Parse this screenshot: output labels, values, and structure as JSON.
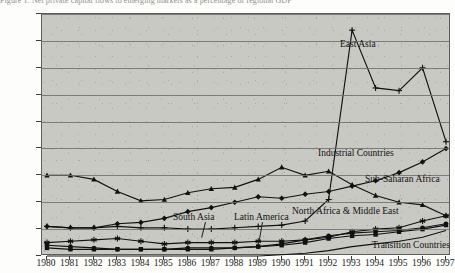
{
  "top_caption": "Figure 1. Net private capital flows to emerging markets as a percentage of regional GDP",
  "chart_data": {
    "type": "line",
    "title": "",
    "xlabel": "",
    "ylabel": "",
    "grid": true,
    "legend_position": "inline-annotations",
    "ylim": [
      0,
      180
    ],
    "ytick_labels": [
      "0%",
      "20%",
      "40%",
      "60%",
      "80%",
      "100%",
      "120%",
      "140%",
      "160%",
      "180%"
    ],
    "ytick_values": [
      0,
      20,
      40,
      60,
      80,
      100,
      120,
      140,
      160,
      180
    ],
    "categories": [
      "1980",
      "1981",
      "1982",
      "1983",
      "1984",
      "1985",
      "1986",
      "1987",
      "1988",
      "1989",
      "1990",
      "1991",
      "1992",
      "1993",
      "1994",
      "1995",
      "1996",
      "1997"
    ],
    "series": [
      {
        "name": "East Asia",
        "marker": "plus",
        "values": [
          22,
          21,
          21,
          22,
          21,
          21,
          20,
          20,
          21,
          22,
          23,
          26,
          42,
          168,
          125,
          123,
          140,
          85
        ]
      },
      {
        "name": "Industrial Countries",
        "marker": "triangle",
        "values": [
          60,
          60,
          57,
          48,
          41,
          42,
          47,
          50,
          51,
          57,
          66,
          60,
          63,
          53,
          45,
          40,
          38,
          30
        ]
      },
      {
        "name": "Sub-Saharan Africa",
        "marker": "diamond",
        "values": [
          22,
          21,
          21,
          24,
          25,
          28,
          33,
          36,
          40,
          44,
          43,
          46,
          48,
          52,
          56,
          62,
          70,
          80
        ]
      },
      {
        "name": "Latin America",
        "marker": "circle",
        "values": [
          8,
          7,
          6,
          5,
          5,
          5,
          6,
          6,
          6,
          7,
          9,
          12,
          15,
          17,
          18,
          19,
          21,
          24
        ]
      },
      {
        "name": "South Asia",
        "marker": "square",
        "values": [
          6,
          5,
          5,
          5,
          5,
          5,
          5,
          5,
          6,
          7,
          8,
          10,
          13,
          15,
          16,
          18,
          20,
          23
        ]
      },
      {
        "name": "North Africa & Middle East",
        "marker": "asterisk",
        "values": [
          10,
          11,
          12,
          13,
          11,
          9,
          10,
          10,
          10,
          11,
          11,
          12,
          14,
          18,
          20,
          21,
          26,
          30
        ]
      },
      {
        "name": "Transition Countries",
        "marker": "line",
        "values": [
          0,
          0,
          0,
          0,
          0,
          0,
          0,
          0,
          0,
          0,
          1,
          2,
          4,
          7,
          9,
          11,
          14,
          19
        ]
      }
    ],
    "annotations": [
      {
        "label": "East Asia"
      },
      {
        "label": "Industrial Countries"
      },
      {
        "label": "Sub-Saharan Africa"
      },
      {
        "label": "South Asia"
      },
      {
        "label": "Latin America"
      },
      {
        "label": "North Africa & Middle East"
      },
      {
        "label": "Transition Countries"
      }
    ]
  }
}
